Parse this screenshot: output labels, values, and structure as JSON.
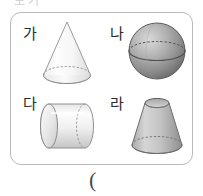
{
  "top_cutoff": {
    "text": "보기"
  },
  "answer": {
    "paren": "("
  },
  "shape_box": {
    "border_color": "#b9b9b9",
    "cells": [
      {
        "label": "가",
        "shape": "cone",
        "shape_name": "cone-figure",
        "fill_light": "#fdfdfd",
        "fill_dark": "#e2e2e2",
        "stroke": "#8a8a8a"
      },
      {
        "label": "나",
        "shape": "sphere",
        "shape_name": "sphere-figure",
        "fill_light": "#cfcfcf",
        "fill_dark": "#6f6f6f",
        "stroke": "#5a5a5a"
      },
      {
        "label": "다",
        "shape": "cylinder",
        "shape_name": "cylinder-figure",
        "fill_light": "#ffffff",
        "fill_dark": "#d0d0d0",
        "stroke": "#8a8a8a"
      },
      {
        "label": "라",
        "shape": "truncated-cone",
        "shape_name": "truncated-cone-figure",
        "fill_light": "#d8d8d8",
        "fill_dark": "#9a9a9a",
        "stroke": "#6d6d6d"
      }
    ]
  }
}
